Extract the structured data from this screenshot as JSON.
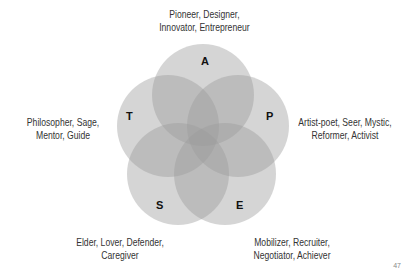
{
  "diagram": {
    "type": "five-circle-venn",
    "circle_fill": "#9a9a9a",
    "circle_opacity": 0.42,
    "circles": [
      {
        "letter": "A",
        "position": "top",
        "caption": [
          "Pioneer, Designer,",
          "Innovator, Entrepreneur"
        ]
      },
      {
        "letter": "P",
        "position": "right",
        "caption": [
          "Artist-poet, Seer, Mystic,",
          "Reformer, Activist"
        ]
      },
      {
        "letter": "E",
        "position": "bottom-right",
        "caption": [
          "Mobilizer, Recruiter,",
          "Negotiator, Achiever"
        ]
      },
      {
        "letter": "S",
        "position": "bottom-left",
        "caption": [
          "Elder, Lover, Defender,",
          "Caregiver"
        ]
      },
      {
        "letter": "T",
        "position": "left",
        "caption": [
          "Philosopher, Sage,",
          "Mentor, Guide"
        ]
      }
    ]
  },
  "page_number": "47"
}
